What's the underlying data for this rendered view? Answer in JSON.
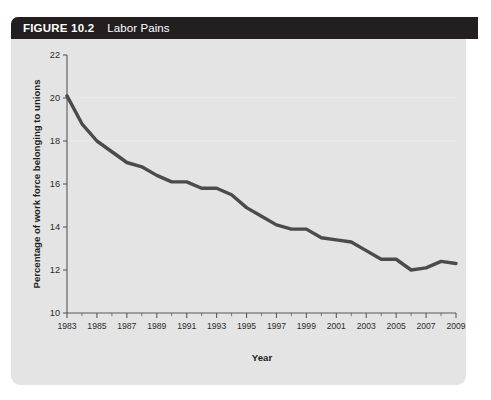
{
  "figure": {
    "number_label": "FIGURE 10.2",
    "title": "Labor Pains"
  },
  "colors": {
    "header_bar": "#231f20",
    "panel_background": "#e4e4e4",
    "line": "#4b4b4d",
    "axis": "#58585a",
    "text": "#1d1d1d"
  },
  "chart_data": {
    "type": "line",
    "title": "Labor Pains",
    "xlabel": "Year",
    "ylabel": "Percentage of work force belonging to unions",
    "xlim": [
      1983,
      2009
    ],
    "ylim": [
      10,
      22
    ],
    "yticks": [
      10,
      12,
      14,
      16,
      18,
      20,
      22
    ],
    "ytick_labels": [
      "10",
      "12",
      "14",
      "16",
      "18",
      "20",
      "22"
    ],
    "xticks": [
      1983,
      1985,
      1987,
      1989,
      1991,
      1993,
      1995,
      1997,
      1999,
      2001,
      2003,
      2005,
      2007,
      2009
    ],
    "xtick_labels": [
      "1983",
      "1985",
      "1987",
      "1989",
      "1991",
      "1993",
      "1995",
      "1997",
      "1999",
      "2001",
      "2003",
      "2005",
      "2007",
      "2009"
    ],
    "minor_xticks_every": 1,
    "grid": false,
    "legend": null,
    "x": [
      1983,
      1984,
      1985,
      1986,
      1987,
      1988,
      1989,
      1990,
      1991,
      1992,
      1993,
      1994,
      1995,
      1996,
      1997,
      1998,
      1999,
      2000,
      2001,
      2002,
      2003,
      2004,
      2005,
      2006,
      2007,
      2008,
      2009
    ],
    "values": [
      20.1,
      18.8,
      18.0,
      17.5,
      17.0,
      16.8,
      16.4,
      16.1,
      16.1,
      15.8,
      15.8,
      15.5,
      14.9,
      14.5,
      14.1,
      13.9,
      13.9,
      13.5,
      13.4,
      13.3,
      12.9,
      12.5,
      12.5,
      12.0,
      12.1,
      12.4,
      12.3
    ],
    "series": [
      {
        "name": "Percentage of work force belonging to unions",
        "values": [
          20.1,
          18.8,
          18.0,
          17.5,
          17.0,
          16.8,
          16.4,
          16.1,
          16.1,
          15.8,
          15.8,
          15.5,
          14.9,
          14.5,
          14.1,
          13.9,
          13.9,
          13.5,
          13.4,
          13.3,
          12.9,
          12.5,
          12.5,
          12.0,
          12.1,
          12.4,
          12.3
        ]
      }
    ]
  }
}
